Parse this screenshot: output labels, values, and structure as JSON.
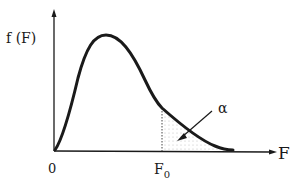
{
  "figure": {
    "type": "probability-density-curve",
    "y_axis_label": "f (F)",
    "x_axis_label": "F",
    "origin_label": "0",
    "critical_value_label": {
      "main": "F",
      "sub": "0"
    },
    "area_label": "α",
    "shaded_region": "right tail beyond F0 (dotted)",
    "colors": {
      "ink": "#1a1a1a",
      "shading": "#bdbdbd",
      "background": "#ffffff"
    }
  }
}
